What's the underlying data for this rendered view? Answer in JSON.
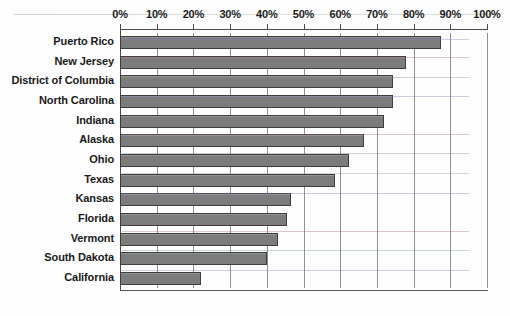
{
  "chart_data": {
    "type": "bar",
    "orientation": "horizontal",
    "title": "",
    "subtitle": "",
    "xlabel": "",
    "ylabel": "",
    "xlim": [
      0,
      100
    ],
    "grid": true,
    "legend": "none",
    "axis_tick_labels": [
      "0%",
      "10%",
      "20%",
      "30%",
      "40%",
      "50%",
      "60%",
      "70%",
      "80%",
      "90%",
      "100%"
    ],
    "axis_tick_values": [
      0,
      10,
      20,
      30,
      40,
      50,
      60,
      70,
      80,
      90,
      100
    ],
    "axis_position": "top",
    "categories": [
      "Puerto Rico",
      "New Jersey",
      "District of Columbia",
      "North Carolina",
      "Indiana",
      "Alaska",
      "Ohio",
      "Texas",
      "Kansas",
      "Florida",
      "Vermont",
      "South Dakota",
      "California"
    ],
    "values": [
      87.5,
      78,
      74.5,
      74.5,
      72,
      66.5,
      62.5,
      58.5,
      46.5,
      45.5,
      43,
      40,
      22
    ],
    "value_unit": "%",
    "series": [
      {
        "name": "Percent",
        "values": [
          87.5,
          78,
          74.5,
          74.5,
          72,
          66.5,
          62.5,
          58.5,
          46.5,
          45.5,
          43,
          40,
          22
        ]
      }
    ]
  },
  "style": {
    "bar_fill": "#7c7c7c",
    "bar_border": "#3d3d3d",
    "gridline_color": "#8f8f8f",
    "axis_color": "#4a4a4a",
    "background": "#fdfdfd",
    "text_color": "#1a1a1a"
  }
}
